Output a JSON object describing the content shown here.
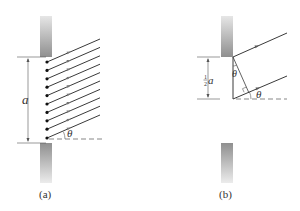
{
  "figure": {
    "panels": [
      {
        "id": "a",
        "caption": "(a)",
        "dimension_label": "a",
        "angle_label": "θ",
        "num_sources": 10
      },
      {
        "id": "b",
        "caption": "(b)",
        "dimension_label_fraction_num": "1",
        "dimension_label_fraction_den": "2",
        "dimension_label_var": "a",
        "angle_label_top": "θ",
        "angle_label_bottom": "θ"
      }
    ],
    "colors": {
      "ray": "#3a3a3a",
      "arrow": "#777777",
      "slit_dark": "#9a9a9a",
      "slit_light": "#e8e8e8",
      "dot": "#111111"
    }
  }
}
